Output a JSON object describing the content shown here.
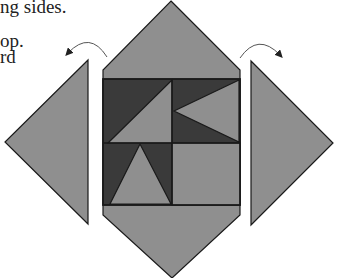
{
  "text": {
    "line1": "ng sides.",
    "line2": "op.",
    "line3": "rd"
  },
  "colors": {
    "medium_gray": "#8f8f8f",
    "dark_gray": "#3a3a3a",
    "outline": "#1a1a1a",
    "arrow": "#333333",
    "background": "#ffffff"
  },
  "diagram": {
    "center_panel": {
      "shape": "elongated hexagon / diamond",
      "points": [
        [
          171,
          1
        ],
        [
          240,
          70
        ],
        [
          240,
          215
        ],
        [
          172,
          278
        ],
        [
          103,
          215
        ],
        [
          103,
          70
        ]
      ]
    },
    "inner_square": {
      "x": 103,
      "y": 79,
      "width": 137,
      "height": 126,
      "quadrants": [
        {
          "name": "top-left",
          "pattern": "diagonal split, dark upper-left, gray lower-right"
        },
        {
          "name": "top-right",
          "pattern": "dark background, gray triangle pointing left"
        },
        {
          "name": "bottom-left",
          "pattern": "dark background, gray triangle pointing up"
        },
        {
          "name": "bottom-right",
          "pattern": "solid gray"
        }
      ]
    },
    "left_flap": {
      "points": [
        [
          88,
          60
        ],
        [
          5,
          142
        ],
        [
          88,
          224
        ]
      ]
    },
    "right_flap": {
      "points": [
        [
          251,
          61
        ],
        [
          333,
          143
        ],
        [
          251,
          225
        ]
      ]
    },
    "arrows": [
      {
        "name": "left-fold-arrow",
        "direction": "counter-clockwise, toward left"
      },
      {
        "name": "right-fold-arrow",
        "direction": "clockwise, toward right"
      }
    ]
  }
}
